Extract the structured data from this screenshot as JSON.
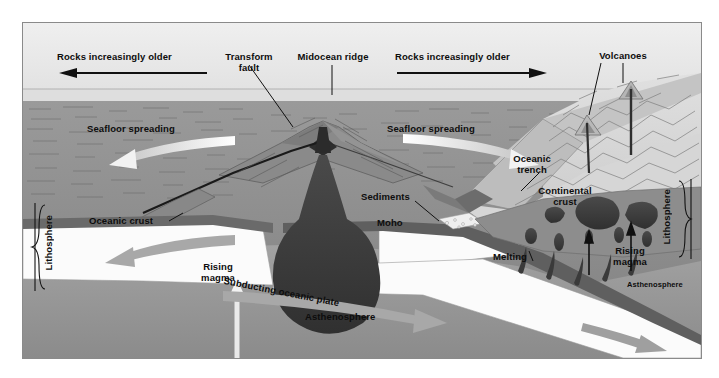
{
  "figure": {
    "type": "geology-cross-section-diagram",
    "palette": {
      "sky": "#ebebeb",
      "water": "#dcdcdc",
      "seafloor": "#8f8f8f",
      "ocean_crust": "#6e6e6e",
      "lithosphere_mantle": "#fbfbfb",
      "asthenosphere": "#9a9a9a",
      "magma": "#3c3c3c",
      "continent": "#d2d2d2",
      "continental_crust": "#8b8b8b",
      "arrow_light": "#f4f4f4",
      "arrow_gray": "#a6a6a6",
      "line": "#111111",
      "frame": "#8a8a8a"
    }
  },
  "labels": {
    "rocks_older_left": "Rocks increasingly older",
    "rocks_older_right": "Rocks increasingly older",
    "transform_fault": "Transform\nfault",
    "midocean_ridge": "Midocean ridge",
    "volcanoes": "Volcanoes",
    "seafloor_spreading_left": "Seafloor spreading",
    "seafloor_spreading_right": "Seafloor spreading",
    "oceanic_trench": "Oceanic\ntrench",
    "sediments": "Sediments",
    "continental_crust": "Continental\ncrust",
    "oceanic_crust": "Oceanic crust",
    "moho": "Moho",
    "melting": "Melting",
    "rising_magma_right": "Rising\nmagma",
    "rising_magma_center": "Rising\nmagma",
    "subducting_plate": "Subducting oceanic plate",
    "asthenosphere_main": "Asthenosphere",
    "asthenosphere_right": "Asthenosphere",
    "lithosphere_left": "Lithosphere",
    "lithosphere_right": "Lithosphere"
  },
  "annotations": {
    "arrow_left_direction": "left",
    "arrow_right_direction": "right",
    "spreading_arrow_left_direction": "left",
    "spreading_arrow_right_direction": "right",
    "plate_arrow_left_direction": "left",
    "subduction_arrow_direction": "down-right",
    "rising_magma_arrow_direction": "up",
    "volcano_leader_count": 2
  }
}
